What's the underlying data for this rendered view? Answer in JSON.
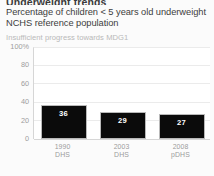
{
  "header": {
    "title": "Underweight trends",
    "subtitle": "Percentage of children < 5 years old underweight NCHS reference population",
    "note": "Insufficient progress towards MDG1"
  },
  "colors": {
    "bar": "#0b0b0b",
    "bar_value_text": "#ffffff",
    "gridline": "#ebebeb",
    "axis": "#d6d6d6",
    "note_text": "#b9b9b9",
    "tick_text": "#9d9d9d",
    "page_background": "#fbfbfb",
    "plot_background": "#ffffff"
  },
  "chart_data": {
    "type": "bar",
    "title": "Underweight trends",
    "subtitle": "Percentage of children < 5 years old underweight NCHS reference population",
    "annotation": "Insufficient progress towards MDG1",
    "categories": [
      "1990",
      "2003",
      "2008"
    ],
    "category_sources": [
      "DHS",
      "DHS",
      "pDHS"
    ],
    "values": [
      36,
      29,
      27
    ],
    "xlabel": "",
    "ylabel": "",
    "ylim": [
      0,
      100
    ],
    "yticks": [
      0,
      20,
      40,
      60,
      80,
      100
    ],
    "ytick_labels": [
      "0",
      "20",
      "40",
      "60",
      "80",
      "100%"
    ],
    "grid": true,
    "legend": "none"
  }
}
